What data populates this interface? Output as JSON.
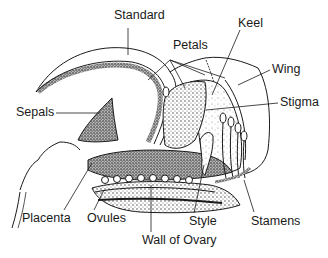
{
  "diagram": {
    "labels": {
      "standard": "Standard",
      "petals": "Petals",
      "keel": "Keel",
      "wing": "Wing",
      "sepals": "Sepals",
      "stigma": "Stigma",
      "placenta": "Placenta",
      "ovules": "Ovules",
      "style": "Style",
      "stamens": "Stamens",
      "wall_of_ovary": "Wall of Ovary"
    },
    "colors": {
      "ink": "#1a1a1a",
      "background": "#ffffff",
      "stipple": "#555555"
    }
  }
}
